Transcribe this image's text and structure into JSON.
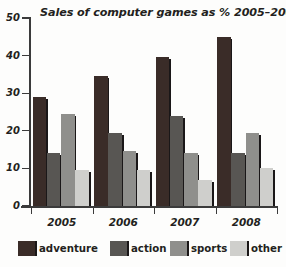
{
  "chart_data": {
    "type": "bar",
    "title": "Sales of computer games as % 2005–2008",
    "xlabel": "",
    "ylabel": "",
    "ylim": [
      0,
      50
    ],
    "yticks": [
      0,
      10,
      20,
      30,
      40,
      50
    ],
    "ytick_labels": [
      "0",
      "10",
      "20",
      "30",
      "40",
      "50"
    ],
    "grid": false,
    "legend_position": "bottom",
    "categories": [
      "2005",
      "2006",
      "2007",
      "2008"
    ],
    "series": [
      {
        "name": "adventure",
        "color": "#3a2c28",
        "values": [
          29,
          34.5,
          39.5,
          45
        ]
      },
      {
        "name": "action",
        "color": "#585653",
        "values": [
          14,
          19.5,
          24,
          14
        ]
      },
      {
        "name": "sports",
        "color": "#8f8f8c",
        "values": [
          24.5,
          14.5,
          14,
          19.5
        ]
      },
      {
        "name": "other",
        "color": "#cfcfcc",
        "values": [
          9.5,
          9.5,
          7,
          10
        ]
      }
    ]
  },
  "legend": {
    "items": [
      {
        "label": "adventure",
        "color": "#3a2c28"
      },
      {
        "label": "action",
        "color": "#585653"
      },
      {
        "label": "sports",
        "color": "#8f8f8c"
      },
      {
        "label": "other",
        "color": "#cfcfcc"
      }
    ]
  },
  "axis": {
    "y_labels": [
      "50",
      "40",
      "30",
      "20",
      "10",
      "0"
    ],
    "x_labels": [
      "2005",
      "2006",
      "2007",
      "2008"
    ]
  }
}
